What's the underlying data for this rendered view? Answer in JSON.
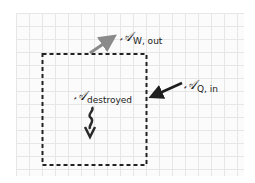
{
  "diagram": {
    "type": "control-volume availability balance",
    "background": "grid paper",
    "colors": {
      "grid": "#e6e6e6",
      "boundary": "#222222",
      "work_arrow": "#8a8a8a",
      "heat_arrow": "#1e1e1e",
      "destroyed_arrow": "#2a2a2a"
    },
    "boundary": {
      "style": "dashed rectangle"
    },
    "labels": {
      "work_out": {
        "symbol": "𝒜",
        "subscript": "W, out"
      },
      "heat_in": {
        "symbol": "𝒜",
        "subscript": "Q, in"
      },
      "destroyed": {
        "symbol": "𝒜",
        "subscript": "destroyed"
      }
    }
  }
}
